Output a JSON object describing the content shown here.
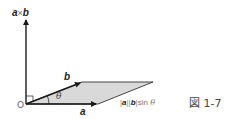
{
  "diagram": {
    "cross_label": {
      "a": "a",
      "op": "×",
      "b": "b"
    },
    "vector_a_label": "a",
    "vector_b_label": "b",
    "origin_label": "O",
    "angle_label": "θ",
    "area_label": {
      "bar1": "|",
      "a": "a",
      "bar2": "||",
      "b": "b",
      "bar3": "|",
      "fn": "sin",
      "theta": "θ"
    },
    "figure_caption": "図 1-7"
  },
  "colors": {
    "line": "#1a1a1a",
    "fill": "#d9d9d9",
    "text": "#222222"
  }
}
